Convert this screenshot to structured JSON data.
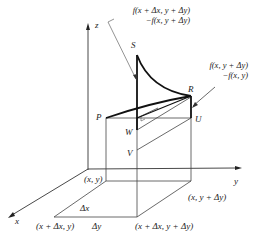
{
  "axes": {
    "z_label": "z",
    "y_label": "y",
    "x_label": "x"
  },
  "points": {
    "S": "S",
    "R": "R",
    "P": "P",
    "W": "W",
    "U": "U",
    "V": "V"
  },
  "annotations": {
    "top_line1": "f(x + Δx, y + Δy)",
    "top_line2": "−f(x, y + Δy)",
    "right_line1": "f(x, y + Δy)",
    "right_line2": "−f(x, y)"
  },
  "base_corners": {
    "xy": "(x, y)",
    "x_y_dy": "(x, y + Δy)",
    "x_dx_y": "(x + Δx, y)",
    "x_dx_y_dy": "(x + Δx, y + Δy)"
  },
  "increments": {
    "dx": "Δx",
    "dy": "Δy"
  },
  "colors": {
    "line": "#222222",
    "thin": "#555555"
  }
}
